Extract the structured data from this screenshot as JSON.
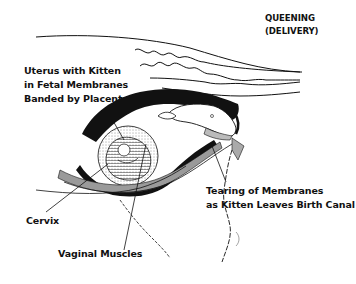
{
  "title": {
    "line1": "QUEENING",
    "line2": "(DELIVERY)"
  },
  "labels": {
    "uterus": {
      "line1": "Uterus with Kitten",
      "line2": "in Fetal Membranes",
      "line3": "Banded by Placenta"
    },
    "tearing": {
      "line1": "Tearing of Membranes",
      "line2": "as Kitten Leaves Birth Canal"
    },
    "cervix": "Cervix",
    "vaginal_muscles": "Vaginal Muscles"
  },
  "colors": {
    "ink": "#111111",
    "shading": "#9a9a9a",
    "background": "#ffffff"
  }
}
